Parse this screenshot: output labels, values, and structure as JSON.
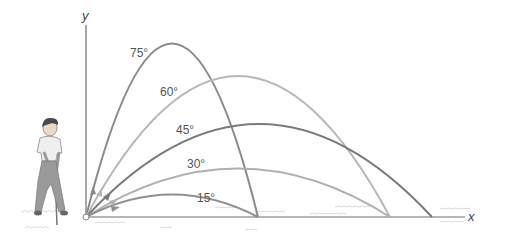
{
  "diagram": {
    "axes": {
      "x_label": "x",
      "y_label": "y"
    },
    "colors": {
      "axis": "#6e6e6e",
      "trajectory_75": "#8a8a8a",
      "trajectory_60": "#b8b8b8",
      "trajectory_45": "#7a7a7a",
      "trajectory_30": "#b0b0b0",
      "trajectory_15": "#8f8f8f"
    },
    "trajectories": [
      {
        "angle": 75,
        "label": "75°"
      },
      {
        "angle": 60,
        "label": "60°"
      },
      {
        "angle": 45,
        "label": "45°"
      },
      {
        "angle": 30,
        "label": "30°"
      },
      {
        "angle": 15,
        "label": "15°"
      }
    ],
    "figure": {
      "subject": "golfer",
      "description": "Golfer swinging a club at the origin"
    }
  }
}
